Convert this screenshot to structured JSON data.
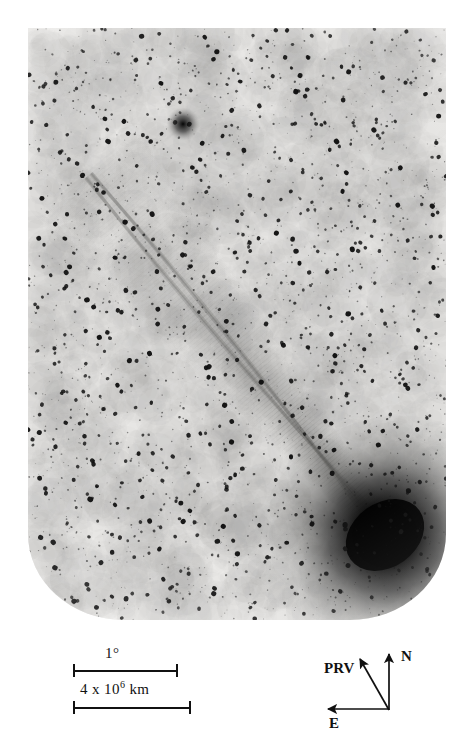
{
  "figure": {
    "name": "comet-negative-plate",
    "background_color": "#ffffff",
    "plate_background_color": "#f0efed",
    "ink_color": "#111111"
  },
  "scale_bars": {
    "angular": {
      "label": "1°",
      "icon": "scale-bar-icon"
    },
    "linear": {
      "label_prefix": "4 x 10",
      "label_exponent": "6",
      "label_suffix": " km",
      "icon": "scale-bar-icon"
    }
  },
  "compass": {
    "north_label": "N",
    "east_label": "E",
    "prv_label": "PRV",
    "north_icon": "arrow-up-icon",
    "east_icon": "arrow-left-icon",
    "prv_icon": "arrow-up-left-icon"
  },
  "chart_data": {
    "type": "scatter",
    "title": "",
    "subtitle": "",
    "xlabel": "",
    "ylabel": "",
    "grid": false,
    "legend_position": "none",
    "rendering": "photographic negative (dark features = bright sky objects)",
    "plate_bounds_px": {
      "x": 28,
      "y": 28,
      "width": 418,
      "height": 592
    },
    "plate_corner_radius_px": {
      "bottom_left": 96,
      "bottom_right": 96
    },
    "annotations": [
      {
        "name": "angular-scale",
        "text": "1°",
        "x_px": 128,
        "y_px": 658,
        "bar_x0_px": 73,
        "bar_x1_px": 177,
        "bar_y_px": 670
      },
      {
        "name": "linear-scale",
        "text": "4 x 10^6 km",
        "x_px": 128,
        "y_px": 693,
        "bar_x0_px": 73,
        "bar_x1_px": 190,
        "bar_y_px": 707
      },
      {
        "name": "north-arrow",
        "text": "N",
        "x0_px": 389,
        "y0_px": 710,
        "x1_px": 389,
        "y1_px": 651
      },
      {
        "name": "east-arrow",
        "text": "E",
        "x0_px": 389,
        "y0_px": 709,
        "x1_px": 325,
        "y1_px": 709
      },
      {
        "name": "prv-arrow",
        "text": "PRV",
        "x0_px": 389,
        "y0_px": 710,
        "x1_px": 358,
        "y1_px": 657
      }
    ],
    "features": [
      {
        "name": "comet-coma",
        "x_px": 385,
        "y_px": 535,
        "radius_px": 46,
        "intensity": 1.0
      },
      {
        "name": "comet-tail-axis",
        "x0_px": 368,
        "y0_px": 512,
        "x1_px": 88,
        "y1_px": 176,
        "width_px": 34
      },
      {
        "name": "bright-field-star",
        "x_px": 183,
        "y_px": 124,
        "radius_px": 7,
        "intensity": 0.85
      }
    ],
    "star_field": {
      "count": 2400,
      "seed": 20240517,
      "min_radius_px": 0.5,
      "max_radius_px": 2.6,
      "x_range_px": [
        0,
        418
      ],
      "y_range_px": [
        0,
        592
      ]
    },
    "tail_streamers": [
      {
        "offset_px": -16,
        "curve": 0.22,
        "opacity": 0.16
      },
      {
        "offset_px": -6,
        "curve": 0.1,
        "opacity": 0.2
      },
      {
        "offset_px": 5,
        "curve": -0.08,
        "opacity": 0.18
      },
      {
        "offset_px": 15,
        "curve": -0.2,
        "opacity": 0.14
      }
    ]
  }
}
